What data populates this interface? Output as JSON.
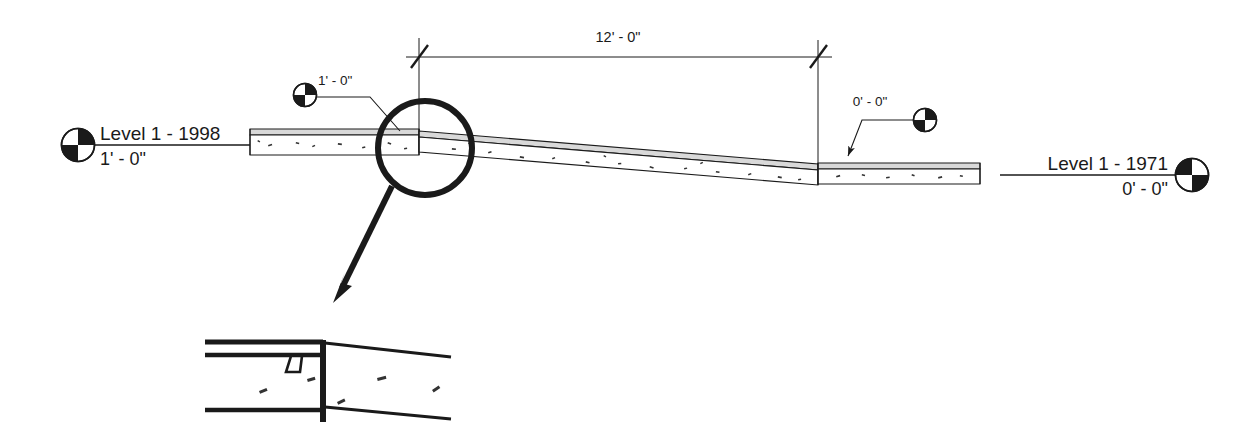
{
  "drawing": {
    "type": "architectural-section",
    "background_color": "#ffffff",
    "line_color": "#1a1a1a",
    "concrete_fill": "#fefefe",
    "levels": [
      {
        "id": "level-left",
        "name": "Level 1 - 1998",
        "elevation": "1' - 0\"",
        "marker_side": "left"
      },
      {
        "id": "level-right",
        "name": "Level 1 - 1971",
        "elevation": "0' - 0\"",
        "marker_side": "right"
      }
    ],
    "dimension": {
      "label": "12' - 0\"",
      "start_x": 419,
      "end_x": 818,
      "line_y": 57
    },
    "spot_elevations": [
      {
        "id": "spot-high",
        "label": "1' - 0\"",
        "marker_x": 305,
        "marker_y": 95
      },
      {
        "id": "spot-low",
        "label": "0' - 0\"",
        "marker_x": 925,
        "marker_y": 120
      }
    ],
    "callout": {
      "id": "detail-callout",
      "center_x": 425,
      "center_y": 148,
      "radius": 47,
      "label": ""
    },
    "detail_view": {
      "id": "enlarged-detail",
      "label": ""
    }
  }
}
